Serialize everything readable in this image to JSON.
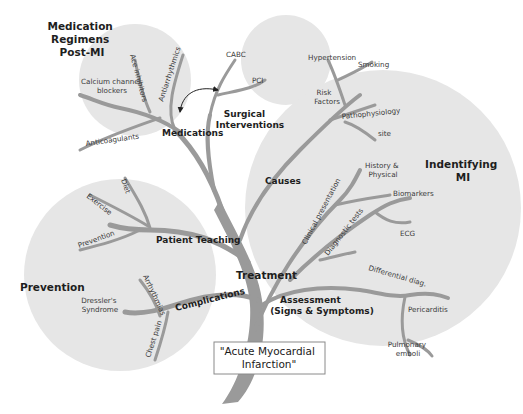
{
  "title": "\"Acute Myocardial Infarction\"",
  "title_lines": [
    "\"Acute Myocardial",
    "Infarction\""
  ],
  "colors": {
    "circle_fill": "#e6e6e6",
    "branch": "#9a9a9a",
    "text": "#2a2a2a",
    "box_border": "#8a8a8a"
  },
  "clusters": {
    "medication": {
      "heading_lines": [
        "Medication",
        "Regimens",
        "Post-MI"
      ],
      "node": "Medications",
      "leaves": {
        "calcium": [
          "Calcium channel",
          "blockers"
        ],
        "ace": "Ace inhibitors",
        "antiarrhythmics": "Antiarrhythmics",
        "anticoagulants": "Anticoagulants"
      }
    },
    "surgical": {
      "node_lines": [
        "Surgical",
        "Interventions"
      ],
      "leaves": {
        "cabc": "CABC",
        "pci": "PCI"
      }
    },
    "identifying": {
      "heading_lines": [
        "Indentifying",
        "MI"
      ],
      "causes": "Causes",
      "risk_factors_lines": [
        "Risk",
        "Factors"
      ],
      "hypertension": "Hypertension",
      "smoking": "Smoking",
      "pathophysiology": "Pathophysiology",
      "site": "site",
      "clinical_presentation": "Clinical presentation",
      "history_lines": [
        "History &",
        "Physical"
      ],
      "diagnostic_tests": "Diagnostic tests",
      "biomarkers": "Biomarkers",
      "ecg": "ECG",
      "differential": "Differential diag.",
      "pericarditis": "Pericarditis",
      "pulmonary_lines": [
        "Pulmonary",
        "emboli"
      ],
      "assessment_lines": [
        "Assessment",
        "(Signs & Symptoms)"
      ]
    },
    "prevention": {
      "heading": "Prevention",
      "patient_teaching": "Patient Teaching",
      "diet": "Diet",
      "exercise": "Exercise",
      "prevention_leaf": "Prevention",
      "complications": "Complications",
      "arrhythmias": "Arrhythmias",
      "dressler_lines": [
        "Dressler's",
        "Syndrome"
      ],
      "chest_pain": "Chest pain"
    }
  },
  "treatment": "Treatment"
}
